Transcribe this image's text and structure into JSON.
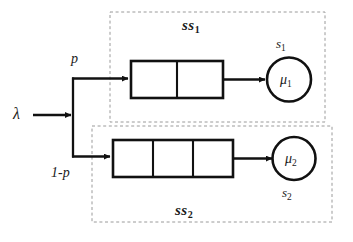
{
  "diagram": {
    "type": "queueing-network",
    "title": "",
    "background_color": "#ffffff",
    "line_color": "#111111",
    "dashed_box_color": "#9a9a9a",
    "arrival": {
      "label": "λ",
      "name": "arrival-rate"
    },
    "split": {
      "upper_label": "p",
      "lower_label": "1-p"
    },
    "subsystems": [
      {
        "id": "ss1",
        "label": "ss",
        "subscript": "1",
        "queue_cells": 2,
        "server_rate_label": "μ",
        "server_rate_subscript": "1",
        "server_count_label": "s",
        "server_count_subscript": "1",
        "server_count_position": "above"
      },
      {
        "id": "ss2",
        "label": "ss",
        "subscript": "2",
        "queue_cells": 3,
        "server_rate_label": "μ",
        "server_rate_subscript": "2",
        "server_count_label": "s",
        "server_count_subscript": "2",
        "server_count_position": "below"
      }
    ]
  }
}
